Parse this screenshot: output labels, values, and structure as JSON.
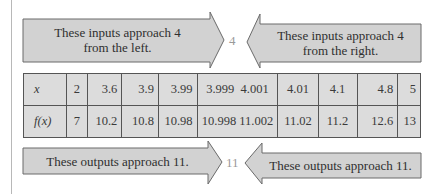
{
  "arrows": {
    "top_left": "These inputs approach 4 from the left.",
    "top_left_line1": "These inputs approach 4",
    "top_left_line2": "from the left.",
    "top_right_line1": "These inputs approach 4",
    "top_right_line2": "from the right.",
    "bottom_left": "These outputs approach 11.",
    "bottom_right": "These outputs approach 11."
  },
  "limits": {
    "x_target": "4",
    "y_target": "11"
  },
  "table": {
    "row_labels": [
      "x",
      "f(x)"
    ],
    "x_values": [
      "2",
      "3.6",
      "3.9",
      "3.99",
      "3.999",
      "4.001",
      "4.01",
      "4.1",
      "4.8",
      "5"
    ],
    "fx_values": [
      "7",
      "10.2",
      "10.8",
      "10.98",
      "10.998",
      "11.002",
      "11.02",
      "11.2",
      "12.6",
      "13"
    ]
  },
  "colors": {
    "arrow_fill": "#d2d2d2",
    "arrow_stroke": "#6a6a6a",
    "table_fill": "#dcdcdc",
    "border": "#555555"
  }
}
